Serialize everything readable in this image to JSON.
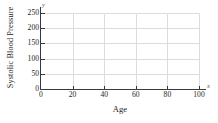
{
  "chart_data": {
    "type": "scatter",
    "title": "",
    "subtitle": "",
    "xlabel": "Age",
    "ylabel": "Systolic Blood Pressure",
    "x_axis_marker": "x",
    "y_axis_marker": "y",
    "xlim": [
      0,
      100
    ],
    "ylim": [
      0,
      250
    ],
    "xticks": [
      0,
      20,
      40,
      60,
      80,
      100
    ],
    "yticks": [
      0,
      50,
      100,
      150,
      200,
      250
    ],
    "xtick_labels": [
      "0",
      "20",
      "40",
      "60",
      "80",
      "100"
    ],
    "ytick_labels": [
      "0",
      "50",
      "100",
      "150",
      "200",
      "250"
    ],
    "grid": true,
    "grid_color": "#dcdcdc",
    "axis_color": "#3a3a3a",
    "text_color": "#231f20",
    "background": "#ffffff",
    "legend": null,
    "legend_position": "none",
    "series": [],
    "values": [],
    "annotations": [],
    "note": "Empty plotting grid with no plotted data points"
  }
}
